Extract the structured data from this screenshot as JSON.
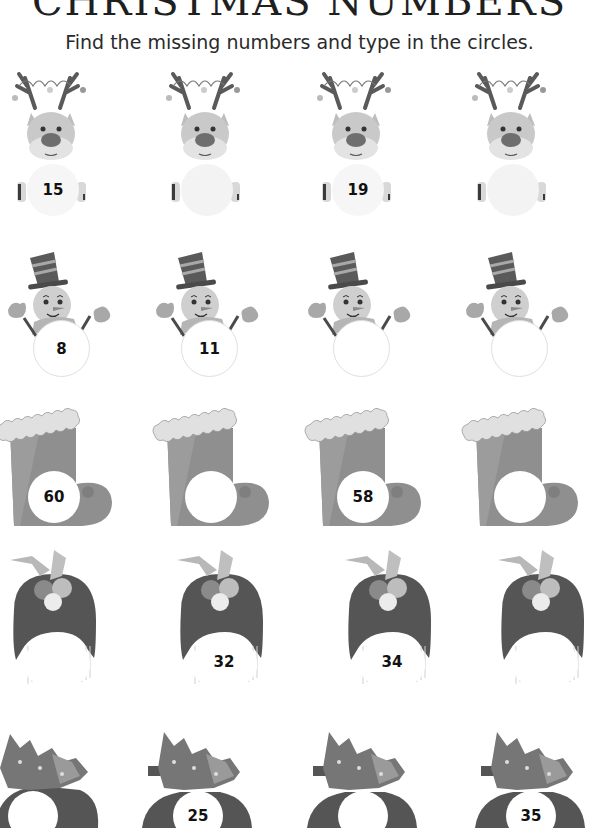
{
  "header": {
    "title": "CHRISTMAS NUMBERS",
    "instruction": "Find the missing numbers and type in the circles."
  },
  "rows": [
    {
      "theme": "reindeer",
      "cells": [
        "15",
        "",
        "19",
        ""
      ]
    },
    {
      "theme": "snowman",
      "cells": [
        "8",
        "11",
        "",
        ""
      ]
    },
    {
      "theme": "stocking",
      "cells": [
        "60",
        "",
        "58",
        ""
      ]
    },
    {
      "theme": "pudding",
      "cells": [
        "",
        "32",
        "34",
        ""
      ]
    },
    {
      "theme": "car-with-tree",
      "cells": [
        "",
        "25",
        "",
        "35"
      ]
    }
  ],
  "colors": {
    "dark": "#4a4a4a",
    "mid": "#8a8a8a",
    "light": "#c4c4c4",
    "pale": "#e6e6e6"
  }
}
